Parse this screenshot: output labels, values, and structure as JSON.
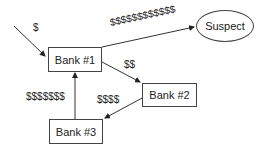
{
  "nodes": {
    "bank1": "Bank #1",
    "bank2": "Bank #2",
    "bank3": "Bank #3",
    "suspect": "Suspect"
  },
  "edges": {
    "in_to_bank1": "$",
    "bank1_to_suspect": "$$$$$$$$$$$$",
    "bank1_to_bank2": "$$",
    "bank2_to_bank3": "$$$$",
    "bank3_to_bank1": "$$$$$$$"
  }
}
